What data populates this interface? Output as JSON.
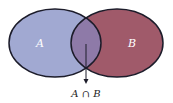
{
  "diagram": {
    "type": "venn",
    "sets": [
      {
        "name": "A",
        "label": "A",
        "color": "#a1a9d2"
      },
      {
        "name": "B",
        "label": "B",
        "color": "#a05a6a"
      }
    ],
    "intersection": {
      "label": "A ∩ B",
      "color": "#8e7aa8"
    },
    "outline_color": "#1c1c2a"
  }
}
